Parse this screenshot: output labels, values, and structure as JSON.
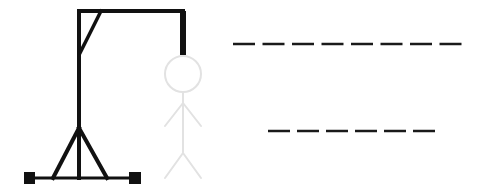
{
  "game": "hangman",
  "colors": {
    "background": "#ffffff",
    "gallows": "#111111",
    "figure": "#e2e2e2",
    "dashes": "#1a1a1a"
  },
  "gallows": {
    "pole": {
      "x": 79,
      "y1": 11,
      "y2": 178
    },
    "beam": {
      "x1": 79,
      "x2": 183,
      "y": 11
    },
    "rope": {
      "x": 183,
      "y1": 11,
      "y2": 55
    },
    "brace": {
      "x1": 101,
      "y1": 11,
      "x2": 80,
      "y2": 53
    },
    "base": {
      "x1": 29,
      "x2": 135,
      "y": 178
    },
    "legs": [
      {
        "x1": 79,
        "y1": 128,
        "x2": 53,
        "y2": 178
      },
      {
        "x1": 79,
        "y1": 128,
        "x2": 107,
        "y2": 178
      }
    ],
    "feet": [
      {
        "x": 24,
        "y": 172
      },
      {
        "x": 129,
        "y": 172
      }
    ]
  },
  "figure": {
    "visible_parts": [
      "head",
      "body",
      "left-arm",
      "right-arm",
      "left-leg",
      "right-leg"
    ],
    "state": "faded"
  },
  "word_rows": [
    {
      "letters": 8,
      "revealed": [
        "",
        "",
        "",
        "",
        "",
        "",
        "",
        ""
      ],
      "y": 44,
      "x_start": 233,
      "dash_width": 22,
      "gap": 7.5
    },
    {
      "letters": 6,
      "revealed": [
        "",
        "",
        "",
        "",
        "",
        ""
      ],
      "y": 131,
      "x_start": 268,
      "dash_width": 22,
      "gap": 7
    }
  ]
}
